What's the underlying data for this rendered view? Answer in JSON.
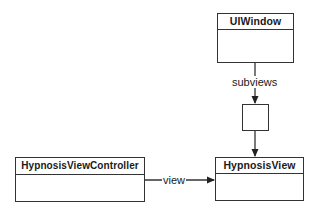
{
  "diagram": {
    "nodes": {
      "uiwindow": {
        "title": "UIWindow"
      },
      "hypnosis_view": {
        "title": "HypnosisView"
      },
      "hypnosis_view_controller": {
        "title": "HypnosisViewController"
      },
      "subviews_array": {
        "title": ""
      }
    },
    "edges": {
      "subviews": {
        "label": "subviews",
        "from": "UIWindow",
        "to": "subviews array"
      },
      "array_to_view": {
        "label": "",
        "from": "subviews array",
        "to": "HypnosisView"
      },
      "view": {
        "label": "view",
        "from": "HypnosisViewController",
        "to": "HypnosisView"
      }
    },
    "colors": {
      "stroke": "#333333",
      "background": "#ffffff"
    }
  }
}
